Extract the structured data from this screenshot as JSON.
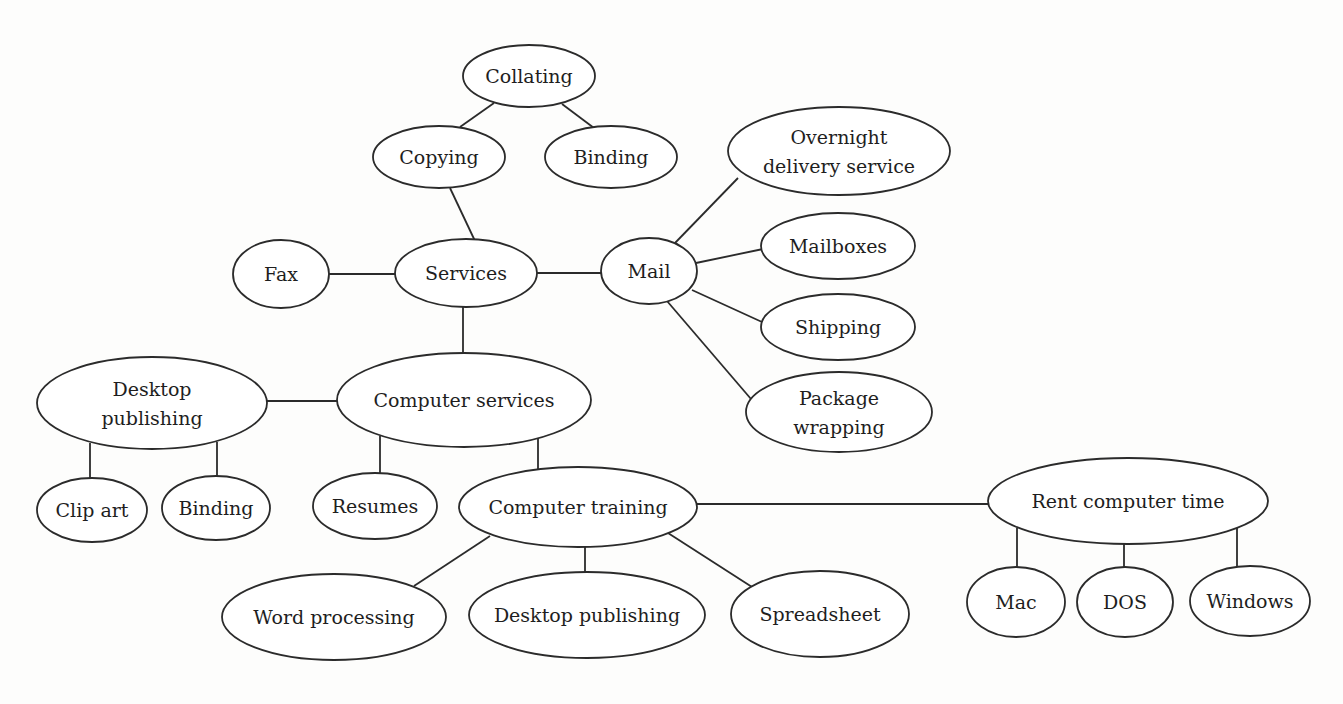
{
  "diagram": {
    "type": "concept-map",
    "root": "Services",
    "nodes": [
      {
        "id": "services",
        "label": [
          "Services"
        ],
        "cx": 466,
        "cy": 273,
        "rx": 71,
        "ry": 34
      },
      {
        "id": "copying",
        "label": [
          "Copying"
        ],
        "cx": 439,
        "cy": 157,
        "rx": 66,
        "ry": 31
      },
      {
        "id": "collating",
        "label": [
          "Collating"
        ],
        "cx": 529,
        "cy": 76,
        "rx": 66,
        "ry": 31
      },
      {
        "id": "binding-1",
        "label": [
          "Binding"
        ],
        "cx": 611,
        "cy": 157,
        "rx": 66,
        "ry": 31
      },
      {
        "id": "fax",
        "label": [
          "Fax"
        ],
        "cx": 281,
        "cy": 274,
        "rx": 48,
        "ry": 34
      },
      {
        "id": "mail",
        "label": [
          "Mail"
        ],
        "cx": 649,
        "cy": 271,
        "rx": 48,
        "ry": 33
      },
      {
        "id": "overnight",
        "label": [
          "Overnight",
          "delivery service"
        ],
        "cx": 839,
        "cy": 151,
        "rx": 111,
        "ry": 44
      },
      {
        "id": "mailboxes",
        "label": [
          "Mailboxes"
        ],
        "cx": 838,
        "cy": 246,
        "rx": 77,
        "ry": 33
      },
      {
        "id": "shipping",
        "label": [
          "Shipping"
        ],
        "cx": 838,
        "cy": 327,
        "rx": 77,
        "ry": 33
      },
      {
        "id": "package-wrapping",
        "label": [
          "Package",
          "wrapping"
        ],
        "cx": 839,
        "cy": 412,
        "rx": 93,
        "ry": 40
      },
      {
        "id": "computer-services",
        "label": [
          "Computer services"
        ],
        "cx": 464,
        "cy": 400,
        "rx": 127,
        "ry": 47
      },
      {
        "id": "desktop-publishing-1",
        "label": [
          "Desktop",
          "publishing"
        ],
        "cx": 152,
        "cy": 403,
        "rx": 115,
        "ry": 46
      },
      {
        "id": "clip-art",
        "label": [
          "Clip art"
        ],
        "cx": 92,
        "cy": 510,
        "rx": 55,
        "ry": 32
      },
      {
        "id": "binding-2",
        "label": [
          "Binding"
        ],
        "cx": 216,
        "cy": 508,
        "rx": 54,
        "ry": 32
      },
      {
        "id": "resumes",
        "label": [
          "Resumes"
        ],
        "cx": 375,
        "cy": 506,
        "rx": 62,
        "ry": 33
      },
      {
        "id": "computer-training",
        "label": [
          "Computer training"
        ],
        "cx": 578,
        "cy": 507,
        "rx": 119,
        "ry": 40
      },
      {
        "id": "word-processing",
        "label": [
          "Word processing"
        ],
        "cx": 334,
        "cy": 617,
        "rx": 112,
        "ry": 43
      },
      {
        "id": "desktop-publishing-2",
        "label": [
          "Desktop publishing"
        ],
        "cx": 587,
        "cy": 615,
        "rx": 118,
        "ry": 43
      },
      {
        "id": "spreadsheet",
        "label": [
          "Spreadsheet"
        ],
        "cx": 820,
        "cy": 614,
        "rx": 89,
        "ry": 43
      },
      {
        "id": "rent-computer-time",
        "label": [
          "Rent computer time"
        ],
        "cx": 1128,
        "cy": 501,
        "rx": 140,
        "ry": 43
      },
      {
        "id": "mac",
        "label": [
          "Mac"
        ],
        "cx": 1016,
        "cy": 602,
        "rx": 49,
        "ry": 35
      },
      {
        "id": "dos",
        "label": [
          "DOS"
        ],
        "cx": 1125,
        "cy": 602,
        "rx": 48,
        "ry": 35
      },
      {
        "id": "windows",
        "label": [
          "Windows"
        ],
        "cx": 1250,
        "cy": 601,
        "rx": 60,
        "ry": 35
      }
    ],
    "edges": [
      {
        "from": "collating",
        "to": "copying",
        "x1": 494,
        "y1": 103,
        "x2": 460,
        "y2": 127
      },
      {
        "from": "collating",
        "to": "binding-1",
        "x1": 562,
        "y1": 104,
        "x2": 594,
        "y2": 128
      },
      {
        "from": "copying",
        "to": "services",
        "x1": 450,
        "y1": 188,
        "x2": 475,
        "y2": 241
      },
      {
        "from": "fax",
        "to": "services",
        "x1": 329,
        "y1": 274,
        "x2": 396,
        "y2": 274
      },
      {
        "from": "services",
        "to": "mail",
        "x1": 537,
        "y1": 273,
        "x2": 601,
        "y2": 273
      },
      {
        "from": "mail",
        "to": "overnight",
        "x1": 675,
        "y1": 243,
        "x2": 738,
        "y2": 178
      },
      {
        "from": "mail",
        "to": "mailboxes",
        "x1": 696,
        "y1": 263,
        "x2": 763,
        "y2": 249
      },
      {
        "from": "mail",
        "to": "shipping",
        "x1": 692,
        "y1": 290,
        "x2": 762,
        "y2": 322
      },
      {
        "from": "mail",
        "to": "package-wrapping",
        "x1": 667,
        "y1": 301,
        "x2": 751,
        "y2": 399
      },
      {
        "from": "services",
        "to": "computer-services",
        "x1": 463,
        "y1": 307,
        "x2": 463,
        "y2": 354
      },
      {
        "from": "desktop-publishing-1",
        "to": "computer-services",
        "x1": 267,
        "y1": 401,
        "x2": 338,
        "y2": 401
      },
      {
        "from": "desktop-publishing-1",
        "to": "clip-art",
        "x1": 90,
        "y1": 443,
        "x2": 90,
        "y2": 478
      },
      {
        "from": "desktop-publishing-1",
        "to": "binding-2",
        "x1": 217,
        "y1": 442,
        "x2": 217,
        "y2": 477
      },
      {
        "from": "computer-services",
        "to": "resumes",
        "x1": 380,
        "y1": 436,
        "x2": 380,
        "y2": 474
      },
      {
        "from": "computer-services",
        "to": "computer-training",
        "x1": 538,
        "y1": 438,
        "x2": 538,
        "y2": 470
      },
      {
        "from": "computer-training",
        "to": "rent-computer-time",
        "x1": 697,
        "y1": 504,
        "x2": 988,
        "y2": 504
      },
      {
        "from": "computer-training",
        "to": "word-processing",
        "x1": 490,
        "y1": 536,
        "x2": 414,
        "y2": 586
      },
      {
        "from": "computer-training",
        "to": "desktop-publishing-2",
        "x1": 585,
        "y1": 547,
        "x2": 585,
        "y2": 573
      },
      {
        "from": "computer-training",
        "to": "spreadsheet",
        "x1": 668,
        "y1": 533,
        "x2": 752,
        "y2": 587
      },
      {
        "from": "rent-computer-time",
        "to": "mac",
        "x1": 1017,
        "y1": 528,
        "x2": 1017,
        "y2": 567
      },
      {
        "from": "rent-computer-time",
        "to": "dos",
        "x1": 1124,
        "y1": 544,
        "x2": 1124,
        "y2": 567
      },
      {
        "from": "rent-computer-time",
        "to": "windows",
        "x1": 1237,
        "y1": 528,
        "x2": 1237,
        "y2": 567
      }
    ]
  }
}
